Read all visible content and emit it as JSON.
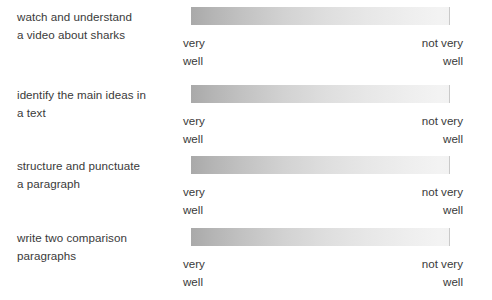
{
  "worksheet": {
    "scale": {
      "low_label_line1": "very",
      "low_label_line2": "well",
      "high_label_line1": "not very",
      "high_label_line2": "well",
      "gradient_dark": "#a9a9a9",
      "gradient_light": "#f3f3f3"
    },
    "rows": [
      {
        "objective_line1": "watch and understand",
        "objective_line2": "a video about sharks"
      },
      {
        "objective_line1": "identify the main ideas in",
        "objective_line2": "a text"
      },
      {
        "objective_line1": "structure and punctuate",
        "objective_line2": "a paragraph"
      },
      {
        "objective_line1": "write two comparison",
        "objective_line2": "paragraphs"
      }
    ]
  }
}
